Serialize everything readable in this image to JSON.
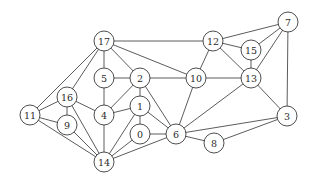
{
  "graph": {
    "node_radius": 10,
    "nodes": [
      {
        "id": "17",
        "x": 104,
        "y": 41
      },
      {
        "id": "12",
        "x": 213,
        "y": 41
      },
      {
        "id": "7",
        "x": 288,
        "y": 22
      },
      {
        "id": "15",
        "x": 251,
        "y": 50
      },
      {
        "id": "5",
        "x": 104,
        "y": 78
      },
      {
        "id": "2",
        "x": 140,
        "y": 78
      },
      {
        "id": "10",
        "x": 196,
        "y": 78
      },
      {
        "id": "13",
        "x": 251,
        "y": 78
      },
      {
        "id": "16",
        "x": 67,
        "y": 97
      },
      {
        "id": "4",
        "x": 104,
        "y": 115
      },
      {
        "id": "1",
        "x": 140,
        "y": 106
      },
      {
        "id": "11",
        "x": 30,
        "y": 115
      },
      {
        "id": "9",
        "x": 67,
        "y": 125
      },
      {
        "id": "0",
        "x": 140,
        "y": 134
      },
      {
        "id": "6",
        "x": 176,
        "y": 134
      },
      {
        "id": "3",
        "x": 287,
        "y": 116
      },
      {
        "id": "8",
        "x": 214,
        "y": 143
      },
      {
        "id": "14",
        "x": 104,
        "y": 162
      }
    ],
    "edges": [
      [
        "17",
        "12"
      ],
      [
        "17",
        "5"
      ],
      [
        "17",
        "2"
      ],
      [
        "17",
        "10"
      ],
      [
        "17",
        "16"
      ],
      [
        "17",
        "11"
      ],
      [
        "12",
        "10"
      ],
      [
        "12",
        "15"
      ],
      [
        "12",
        "13"
      ],
      [
        "12",
        "7"
      ],
      [
        "7",
        "15"
      ],
      [
        "7",
        "13"
      ],
      [
        "7",
        "3"
      ],
      [
        "15",
        "13"
      ],
      [
        "5",
        "2"
      ],
      [
        "5",
        "4"
      ],
      [
        "2",
        "10"
      ],
      [
        "2",
        "4"
      ],
      [
        "2",
        "1"
      ],
      [
        "2",
        "6"
      ],
      [
        "10",
        "13"
      ],
      [
        "10",
        "6"
      ],
      [
        "13",
        "6"
      ],
      [
        "13",
        "3"
      ],
      [
        "16",
        "11"
      ],
      [
        "16",
        "9"
      ],
      [
        "16",
        "4"
      ],
      [
        "16",
        "14"
      ],
      [
        "11",
        "9"
      ],
      [
        "11",
        "14"
      ],
      [
        "9",
        "14"
      ],
      [
        "4",
        "1"
      ],
      [
        "4",
        "14"
      ],
      [
        "1",
        "0"
      ],
      [
        "1",
        "6"
      ],
      [
        "1",
        "14"
      ],
      [
        "0",
        "6"
      ],
      [
        "0",
        "14"
      ],
      [
        "6",
        "14"
      ],
      [
        "6",
        "3"
      ],
      [
        "6",
        "8"
      ],
      [
        "8",
        "3"
      ]
    ]
  }
}
